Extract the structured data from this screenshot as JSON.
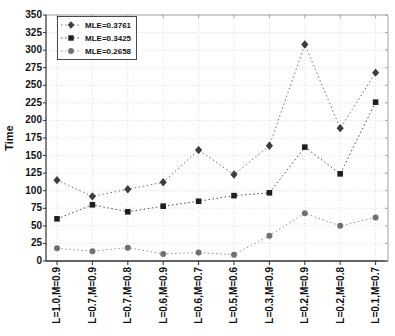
{
  "chart_data": {
    "type": "line",
    "title": "",
    "xlabel": "",
    "ylabel": "Time",
    "ylim": [
      0,
      350
    ],
    "ytick_step": 25,
    "grid": true,
    "legend_position": "top-left",
    "categories": [
      "L=1.0,M=0.9",
      "L=0.7,M=0.9",
      "L=0.7,M=0.8",
      "L=0.6,M=0.9",
      "L=0.6,M=0.7",
      "L=0.5,M=0.6",
      "L=0.3,M=0.9",
      "L=0.2,M=0.9",
      "L=0.2,M=0.8",
      "L=0.1,M=0.7"
    ],
    "series": [
      {
        "name": "MLE=0.3761",
        "marker": "diamond",
        "marker_color": "#3d3d3d",
        "line_color": "#6f6f6f",
        "line_style": "dotted",
        "values": [
          115,
          92,
          102,
          112,
          158,
          123,
          164,
          308,
          189,
          268
        ]
      },
      {
        "name": "MLE=0.3425",
        "marker": "square",
        "marker_color": "#1f1f1f",
        "line_color": "#4a4a4a",
        "line_style": "dotted",
        "values": [
          60,
          80,
          70,
          78,
          85,
          93,
          97,
          162,
          124,
          226
        ]
      },
      {
        "name": "MLE=0.2658",
        "marker": "circle",
        "marker_color": "#707070",
        "line_color": "#8f8f8f",
        "line_style": "dotted",
        "values": [
          18,
          14,
          19,
          10,
          12,
          9,
          36,
          68,
          50,
          62
        ]
      }
    ],
    "colors": {
      "grid": "#d8d8d8",
      "axis": "#2f2f2f",
      "box_border": "#a3a3a3",
      "tick_text": "#111111",
      "background": "#ffffff"
    }
  }
}
